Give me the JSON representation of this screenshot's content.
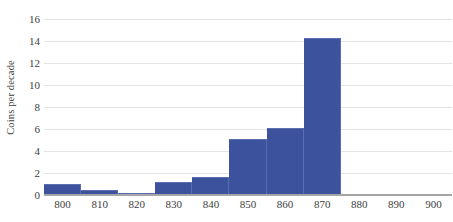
{
  "chart_data": {
    "type": "bar",
    "title": "",
    "subtitle": "",
    "xlabel": "",
    "ylabel": "Coins per decade",
    "grid": true,
    "legend": false,
    "legend_position": "none",
    "bar_color": "#3c529c",
    "gridline_color": "#e4e4e4",
    "axis_color": "#a6a6a6",
    "xlim": [
      795,
      905
    ],
    "ylim": [
      0,
      16
    ],
    "xticks": [
      "800",
      "810",
      "820",
      "830",
      "840",
      "850",
      "860",
      "870",
      "880",
      "890",
      "900"
    ],
    "xtick_values": [
      800,
      810,
      820,
      830,
      840,
      850,
      860,
      870,
      880,
      890,
      900
    ],
    "yticks": [
      "0",
      "2",
      "4",
      "6",
      "8",
      "10",
      "12",
      "14",
      "16"
    ],
    "ytick_values": [
      0,
      2,
      4,
      6,
      8,
      10,
      12,
      14,
      16
    ],
    "bin_width": 10,
    "categories": [
      "795-805",
      "805-815",
      "815-825",
      "825-835",
      "835-845",
      "845-855",
      "855-865",
      "865-875",
      "875-885",
      "885-895",
      "895-905"
    ],
    "bin_starts": [
      795,
      805,
      815,
      825,
      835,
      845,
      855,
      865,
      875,
      885,
      895
    ],
    "values": [
      1.0,
      0.5,
      0.2,
      1.2,
      1.6,
      5.1,
      6.1,
      14.3,
      0,
      0,
      0
    ]
  }
}
